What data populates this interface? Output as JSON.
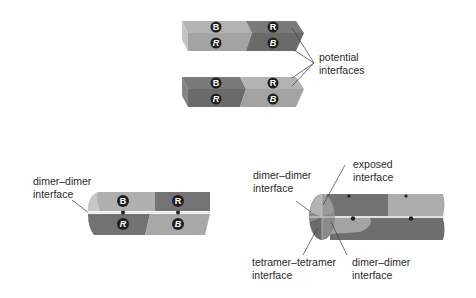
{
  "colors": {
    "light": "#a6a6a6",
    "light_top": "#b8b8b8",
    "dark": "#6f6f6f",
    "dark_top": "#808080",
    "badge": "#1f1f1f",
    "line": "#3a3a3a"
  },
  "top_panel": {
    "rod1": {
      "badges_top": [
        "B",
        "R"
      ],
      "badges_bottom": [
        "R",
        "B"
      ]
    },
    "rod2": {
      "badges_top": [
        "B",
        "R"
      ],
      "badges_bottom": [
        "R",
        "B"
      ]
    },
    "label_line1": "potential",
    "label_line2": "interfaces"
  },
  "bottom_left_panel": {
    "label_line1": "dimer–dimer",
    "label_line2": "interface",
    "badges_top": [
      "B",
      "R"
    ],
    "badges_bottom": [
      "R",
      "B"
    ]
  },
  "bottom_right_panel": {
    "labels": {
      "dimer_dimer_top_1": "dimer–dimer",
      "dimer_dimer_top_2": "interface",
      "exposed_1": "exposed",
      "exposed_2": "interface",
      "tetramer_1": "tetramer–tetramer",
      "tetramer_2": "interface",
      "dimer_dimer_bottom_1": "dimer–dimer",
      "dimer_dimer_bottom_2": "interface"
    }
  }
}
